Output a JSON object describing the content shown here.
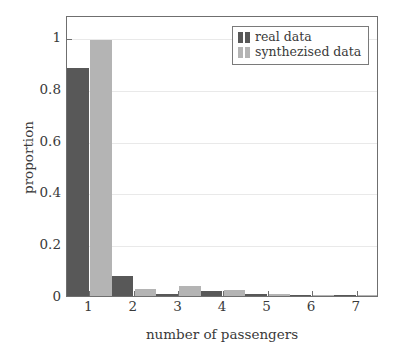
{
  "chart_data": {
    "type": "bar",
    "title": "",
    "xlabel": "number of passengers",
    "ylabel": "proportion",
    "categories": [
      "1",
      "2",
      "3",
      "4",
      "5",
      "6",
      "7"
    ],
    "series": [
      {
        "name": "real data",
        "color": "#585858",
        "values": [
          0.88,
          0.077,
          0.008,
          0.018,
          0.008,
          0.004,
          0.004
        ]
      },
      {
        "name": "synthezised data",
        "color": "#b4b4b4",
        "values": [
          0.99,
          0.026,
          0.037,
          0.023,
          0.006,
          0.004,
          0.001
        ]
      }
    ],
    "ylim": [
      0,
      1.085
    ],
    "yticks": [
      0,
      0.2,
      0.4,
      0.6,
      0.8,
      1
    ],
    "ytick_labels": [
      "0",
      "0.2",
      "0.4",
      "0.6",
      "0.8",
      "1"
    ],
    "xtick_labels": [
      "1",
      "2",
      "3",
      "4",
      "5",
      "6",
      "7"
    ],
    "grid": "horizontal",
    "grid_color": "#e9e9e9",
    "legend_position": "top-right",
    "frame_color": "#6f6f6f",
    "background": "#ffffff"
  },
  "legend": {
    "entries": [
      {
        "label": "real data"
      },
      {
        "label": "synthezised data"
      }
    ]
  },
  "axes": {
    "y_label": "proportion",
    "x_label": "number of passengers"
  }
}
